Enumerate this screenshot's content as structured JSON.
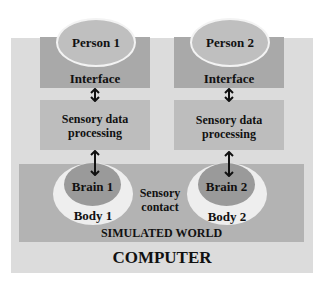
{
  "diagram": {
    "persons": [
      {
        "label": "Person 1"
      },
      {
        "label": "Person 2"
      }
    ],
    "interface_label": "Interface",
    "sensory_processing_label_line1": "Sensory data",
    "sensory_processing_label_line2": "processing",
    "brains": [
      {
        "label": "Brain 1"
      },
      {
        "label": "Brain 2"
      }
    ],
    "bodies": [
      {
        "label": "Body 1"
      },
      {
        "label": "Body 2"
      }
    ],
    "sensory_contact_line1": "Sensory",
    "sensory_contact_line2": "contact",
    "simulated_world_label": "SIMULATED WORLD",
    "computer_label": "COMPUTER",
    "colors": {
      "computer_bg": "#dcdcdc",
      "interface_bg": "#a9a9a9",
      "sensory_bg": "#bdbdbd",
      "world_bg": "#b3b3b3",
      "person_bg": "#bfbfbf",
      "body_bg": "#eeeeee",
      "brain_bg": "#9a9a9a"
    }
  }
}
